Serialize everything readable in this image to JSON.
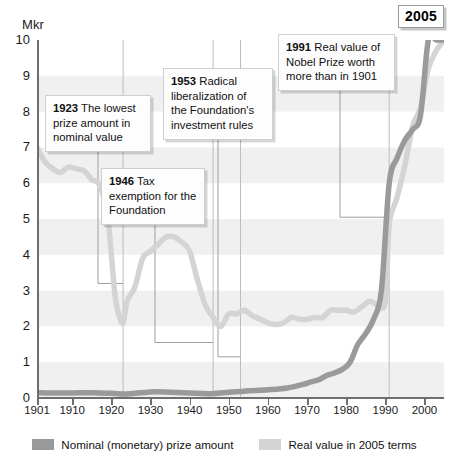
{
  "chart_data": {
    "type": "line",
    "title": "",
    "ylabel": "Mkr",
    "xlabel": "",
    "ylim": [
      0,
      10
    ],
    "xlim": [
      1901,
      2005
    ],
    "grid": "horizontal-bands",
    "legend_position": "bottom",
    "yticks": [
      "10",
      "9",
      "8",
      "7",
      "6",
      "5",
      "4",
      "3",
      "2",
      "1",
      "0"
    ],
    "xticks": [
      "1901",
      "1910",
      "1920",
      "1930",
      "1940",
      "1950",
      "1960",
      "1970",
      "1980",
      "1990",
      "2000"
    ],
    "series": [
      {
        "name": "Nominal (monetary) prize amount",
        "color": "#9a9a9a",
        "x": [
          1901,
          1905,
          1910,
          1915,
          1920,
          1923,
          1925,
          1930,
          1935,
          1940,
          1945,
          1950,
          1953,
          1955,
          1960,
          1965,
          1969,
          1971,
          1973,
          1975,
          1977,
          1979,
          1981,
          1983,
          1985,
          1987,
          1989,
          1991,
          1993,
          1995,
          1997,
          1999,
          2001,
          2003,
          2005
        ],
        "values": [
          0.15,
          0.14,
          0.14,
          0.15,
          0.13,
          0.11,
          0.12,
          0.17,
          0.16,
          0.14,
          0.12,
          0.16,
          0.18,
          0.2,
          0.23,
          0.28,
          0.38,
          0.45,
          0.51,
          0.63,
          0.7,
          0.8,
          1.0,
          1.5,
          1.8,
          2.2,
          3.0,
          6.0,
          6.7,
          7.2,
          7.5,
          7.9,
          10.0,
          10.0,
          10.0
        ]
      },
      {
        "name": "Real value in 2005 terms",
        "color": "#d4d4d4",
        "x": [
          1901,
          1903,
          1905,
          1907,
          1909,
          1911,
          1913,
          1915,
          1917,
          1919,
          1920,
          1921,
          1922,
          1923,
          1924,
          1926,
          1928,
          1930,
          1932,
          1934,
          1936,
          1938,
          1940,
          1942,
          1944,
          1946,
          1948,
          1950,
          1952,
          1954,
          1956,
          1958,
          1960,
          1962,
          1964,
          1966,
          1968,
          1970,
          1972,
          1974,
          1976,
          1978,
          1980,
          1982,
          1984,
          1986,
          1988,
          1990,
          1991,
          1993,
          1995,
          1997,
          1999,
          2001,
          2003,
          2005
        ],
        "values": [
          7.0,
          6.6,
          6.4,
          6.3,
          6.45,
          6.4,
          6.35,
          6.1,
          5.95,
          5.1,
          4.0,
          2.8,
          2.3,
          2.1,
          2.7,
          3.1,
          3.9,
          4.1,
          4.3,
          4.5,
          4.5,
          4.35,
          4.1,
          3.3,
          2.6,
          2.25,
          2.0,
          2.35,
          2.35,
          2.45,
          2.3,
          2.2,
          2.1,
          2.05,
          2.1,
          2.25,
          2.2,
          2.2,
          2.25,
          2.25,
          2.45,
          2.45,
          2.45,
          2.4,
          2.55,
          2.7,
          2.6,
          2.7,
          4.85,
          5.6,
          6.5,
          7.6,
          8.1,
          9.2,
          9.7,
          10.0
        ]
      }
    ],
    "annotations": [
      {
        "year": "1923",
        "text": "The lowest prize amount in nominal value"
      },
      {
        "year": "1946",
        "text": "Tax exemption for the Foundation"
      },
      {
        "year": "1953",
        "text": "Radical liberalization of the Foundation's investment rules"
      },
      {
        "year": "1991",
        "text": "Real value of Nobel Prize worth more than in 1901"
      }
    ],
    "end_marker": "2005"
  },
  "axis": {
    "unit_label": "Mkr"
  },
  "callouts": {
    "c1923": {
      "year": "1923",
      "body": " The lowest prize amount in nominal value"
    },
    "c1946": {
      "year": "1946",
      "body": " Tax exemption for the Foundation"
    },
    "c1953": {
      "year": "1953",
      "body": " Radical liberalization of the Foundation's investment rules"
    },
    "c1991": {
      "year": "1991",
      "body": " Real value of Nobel Prize worth more than in 1901"
    }
  },
  "year_badge": {
    "label": "2005"
  },
  "legend": {
    "nominal": "Nominal (monetary) prize amount",
    "real": "Real value in 2005 terms"
  }
}
